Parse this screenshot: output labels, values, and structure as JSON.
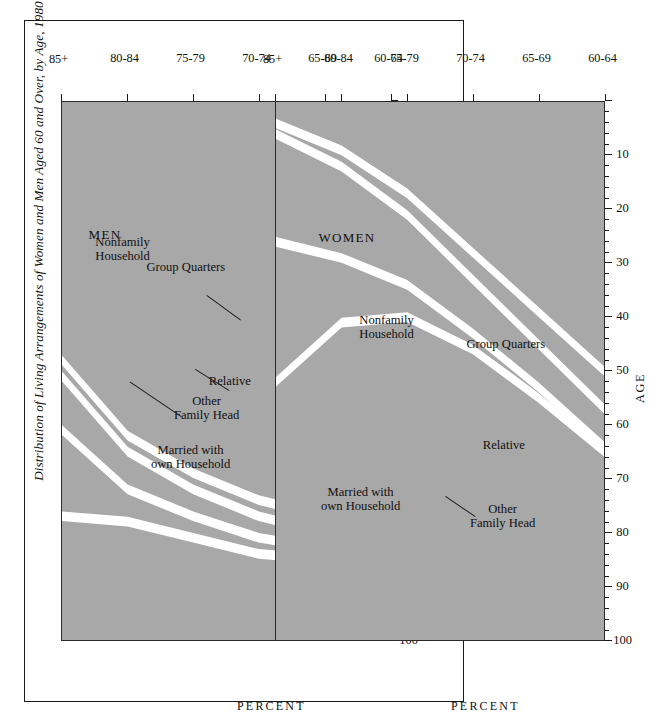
{
  "figure": {
    "title": "Distribution of Living Arrangements of Women and Men Aged 60 and Over, by Age, 1980",
    "band_fill": "#a8a8a8",
    "gap_color": "#ffffff",
    "axis_color": "#1a1a1a"
  },
  "axes": {
    "y_title": "PERCENT",
    "y_ticks": [
      "100",
      "90",
      "80",
      "70",
      "60",
      "50",
      "40",
      "30",
      "20",
      "10"
    ],
    "y_min": 0,
    "y_max": 100,
    "x_title": "AGE",
    "x_ticks": [
      "60-64",
      "65-69",
      "70-74",
      "75-79",
      "80-84",
      "85+"
    ]
  },
  "chart_data": {
    "type": "area",
    "title": "Distribution of Living Arrangements of Women and Men Aged 60 and Over, by Age, 1980",
    "xlabel": "AGE",
    "ylabel": "PERCENT",
    "ylim": [
      0,
      100
    ],
    "grid": false,
    "legend": "in-plot band labels",
    "categories": [
      "60-64",
      "65-69",
      "70-74",
      "75-79",
      "80-84",
      "85+"
    ],
    "panels": [
      {
        "name": "WOMEN",
        "label": "WOMEN",
        "series": [
          {
            "name": "Married with own Household",
            "values": [
              50,
              39,
              28,
              17,
              9,
              4
            ]
          },
          {
            "name": "Other Family Head",
            "values": [
              7,
              6,
              5,
              4,
              3,
              2
            ]
          },
          {
            "name": "Relative",
            "values": [
              7,
              8,
              10,
              13,
              17,
              20
            ]
          },
          {
            "name": "Group Quarters",
            "values": [
              1,
              2,
              3,
              6,
              12,
              26
            ]
          },
          {
            "name": "Nonfamily Household",
            "values": [
              35,
              45,
              54,
              60,
              59,
              48
            ]
          }
        ]
      },
      {
        "name": "MEN",
        "label": "MEN",
        "series": [
          {
            "name": "Married with own Household",
            "values": [
              78,
              77,
              74,
              69,
              62,
              48
            ]
          },
          {
            "name": "Other Family Head",
            "values": [
              3,
              3,
              3,
              3,
              3,
              3
            ]
          },
          {
            "name": "Relative",
            "values": [
              3,
              3,
              4,
              5,
              7,
              10
            ]
          },
          {
            "name": "Group Quarters",
            "values": [
              2,
              2,
              3,
              4,
              6,
              16
            ]
          },
          {
            "name": "Nonfamily Household",
            "values": [
              14,
              15,
              16,
              19,
              22,
              23
            ]
          }
        ]
      }
    ]
  },
  "panels": {
    "women": {
      "label": "WOMEN",
      "bands": {
        "nonfamily": "Nonfamily\nHousehold",
        "group_quarters": "Group Quarters",
        "relative": "Relative",
        "other_family_head": "Other\nFamily Head",
        "married": "Married with\nown Household"
      }
    },
    "men": {
      "label": "MEN",
      "bands": {
        "nonfamily": "Nonfamily\nHousehold",
        "group_quarters": "Group Quarters",
        "relative": "Relative",
        "other_family_head": "Other\nFamily Head",
        "married": "Married with\nown Household"
      }
    }
  }
}
